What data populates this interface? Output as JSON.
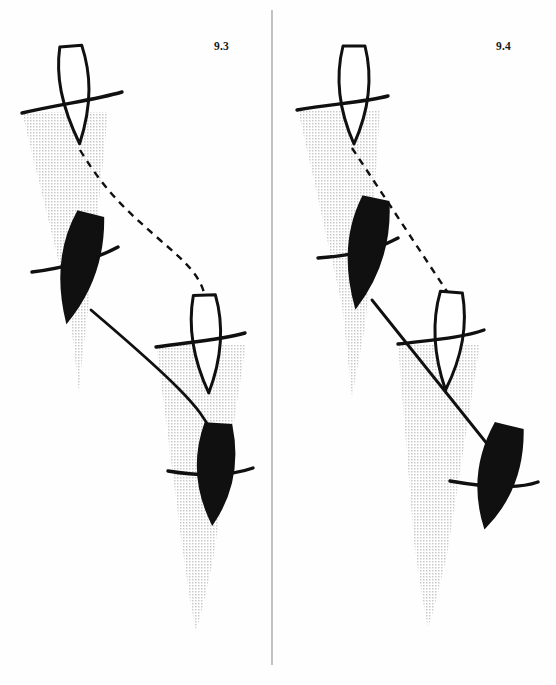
{
  "figure": {
    "background_color": "#fefefe",
    "ink_color": "#101010",
    "shadow_color": "#d8d8d8",
    "divider_color": "#9a9a9a",
    "width": 556,
    "height": 685
  },
  "panels": [
    {
      "id": "panel-left",
      "label": "9.3",
      "label_x": 214,
      "label_y": 40,
      "description": "Shuttlecock path curving: open shuttle top-left, filled shuttle mid-left, open shuttle mid-right, filled shuttle lower-right",
      "shuttles": [
        {
          "id": "shuttle-1",
          "fill": "open",
          "cx": 74,
          "cy": 92,
          "half_width": 17,
          "half_height": 48,
          "rotation": -4,
          "arc_label": "racquet-arc"
        },
        {
          "id": "shuttle-2",
          "fill": "solid",
          "cx": 78,
          "cy": 265,
          "half_width": 22,
          "half_height": 55,
          "rotation": 14,
          "arc_label": "racquet-arc"
        },
        {
          "id": "shuttle-3",
          "fill": "open",
          "cx": 206,
          "cy": 343,
          "half_width": 17,
          "half_height": 48,
          "rotation": -2,
          "arc_label": "racquet-arc"
        },
        {
          "id": "shuttle-4",
          "fill": "solid",
          "cx": 215,
          "cy": 472,
          "half_width": 22,
          "half_height": 52,
          "rotation": 4,
          "arc_label": "racquet-arc"
        }
      ],
      "wedges": [
        {
          "id": "wedge-1",
          "top_left_x": 22,
          "top_right_x": 108,
          "top_y": 112,
          "tip_x": 79,
          "tip_y": 392
        },
        {
          "id": "wedge-2",
          "top_left_x": 156,
          "top_right_x": 246,
          "top_y": 344,
          "tip_x": 196,
          "tip_y": 631
        }
      ],
      "trajectory": {
        "dashed_from": "shuttle-1-tip",
        "solid_from": "shuttle-2-tip",
        "style": "curved S-shape",
        "dash_pattern": "7,6"
      }
    },
    {
      "id": "panel-right",
      "label": "9.4",
      "label_x": 496,
      "label_y": 40,
      "description": "Shuttlecock path straight-line: open shuttle top, filled shuttle mid-left, open shuttle mid-right, filled shuttle lower-right",
      "shuttles": [
        {
          "id": "shuttle-1",
          "fill": "open",
          "cx": 354,
          "cy": 92,
          "half_width": 17,
          "half_height": 48,
          "rotation": 0,
          "arc_label": "racquet-arc"
        },
        {
          "id": "shuttle-2",
          "fill": "solid",
          "cx": 365,
          "cy": 250,
          "half_width": 23,
          "half_height": 55,
          "rotation": 12,
          "arc_label": "racquet-arc"
        },
        {
          "id": "shuttle-3",
          "fill": "open",
          "cx": 448,
          "cy": 340,
          "half_width": 17,
          "half_height": 48,
          "rotation": 4,
          "arc_label": "racquet-arc"
        },
        {
          "id": "shuttle-4",
          "fill": "solid",
          "cx": 497,
          "cy": 475,
          "half_width": 24,
          "half_height": 53,
          "rotation": 14,
          "arc_label": "racquet-arc"
        }
      ],
      "wedges": [
        {
          "id": "wedge-1",
          "top_left_x": 298,
          "top_right_x": 380,
          "top_y": 110,
          "tip_x": 352,
          "tip_y": 397
        },
        {
          "id": "wedge-2",
          "top_left_x": 398,
          "top_right_x": 480,
          "top_y": 344,
          "tip_x": 428,
          "tip_y": 628
        }
      ],
      "trajectory": {
        "dashed_from": "shuttle-1-tip",
        "solid_from": "shuttle-2-tip",
        "style": "straight line",
        "dash_pattern": "7,6"
      }
    }
  ],
  "divider": {
    "id": "panel-divider",
    "x": 272,
    "y_top": 10,
    "y_bottom": 665,
    "color": "#9a9a9a",
    "width": 1.2
  }
}
